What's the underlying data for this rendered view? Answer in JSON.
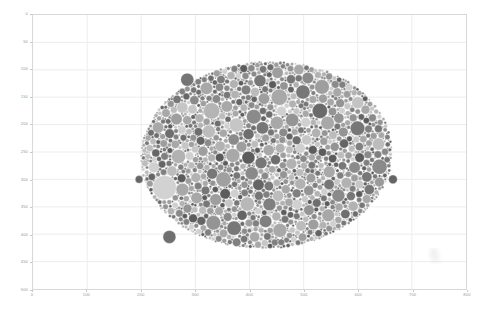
{
  "figure": {
    "type": "bubble-scatter",
    "background_color": "#ffffff",
    "frame_color": "#d8d8d8",
    "grid_color": "#ededed",
    "tick_label_color": "#9a9a9a"
  },
  "axes": {
    "x": {
      "label": "",
      "min": 0,
      "max": 800,
      "tick_step": 100,
      "ticks": [
        "0",
        "100",
        "200",
        "300",
        "400",
        "500",
        "600",
        "700",
        "800"
      ]
    },
    "y": {
      "label": "",
      "min": 0,
      "max": 500,
      "inverted": true,
      "tick_step": 50,
      "ticks": [
        "0",
        "50",
        "100",
        "150",
        "200",
        "250",
        "300",
        "350",
        "400",
        "450",
        "500"
      ]
    }
  },
  "chart_data": {
    "type": "scatter",
    "title": "",
    "subtitle": "",
    "xlabel": "",
    "ylabel": "",
    "xlim": [
      0,
      800
    ],
    "ylim": [
      500,
      0
    ],
    "grid": true,
    "legend": "none",
    "marker": "circle",
    "colormap": "grayscale",
    "color_range": [
      "#4f4f4f",
      "#d2d2d2"
    ],
    "point_count": 1400,
    "radius_range": [
      1.2,
      22
    ],
    "cluster_bounds_data": {
      "x_min": 170,
      "x_max": 660,
      "y_min": 62,
      "y_max": 435
    },
    "notable_points": [
      {
        "x": 243,
        "y": 315,
        "r": 22,
        "shade": "#d2d2d2",
        "note": "largest light bubble, left-center"
      },
      {
        "x": 455,
        "y": 150,
        "r": 15,
        "shade": "#a8a8a8",
        "note": "large mid bubble upper-right"
      },
      {
        "x": 530,
        "y": 175,
        "r": 14,
        "shade": "#6a6a6a",
        "note": "large dark bubble upper-right"
      },
      {
        "x": 252,
        "y": 405,
        "r": 12,
        "shade": "#6f6f6f",
        "note": "dark outlier lower-left"
      },
      {
        "x": 330,
        "y": 175,
        "r": 15,
        "shade": "#b4b4b4",
        "note": "large light bubble upper-left of core"
      },
      {
        "x": 352,
        "y": 300,
        "r": 14,
        "shade": "#a0a0a0",
        "note": "large bubble center"
      },
      {
        "x": 396,
        "y": 345,
        "r": 13,
        "shade": "#b8b8b8",
        "note": "light bubble center-low"
      },
      {
        "x": 640,
        "y": 305,
        "r": 9,
        "shade": "#9a9a9a",
        "note": "right-edge satellite"
      },
      {
        "x": 600,
        "y": 160,
        "r": 11,
        "shade": "#c4c4c4",
        "note": "light bubble right"
      },
      {
        "x": 285,
        "y": 118,
        "r": 12,
        "shade": "#757575",
        "note": "dark bubble top-left arm"
      },
      {
        "x": 345,
        "y": 260,
        "r": 8,
        "shade": "#5a5a5a",
        "note": "very dark small bubble center"
      }
    ]
  }
}
